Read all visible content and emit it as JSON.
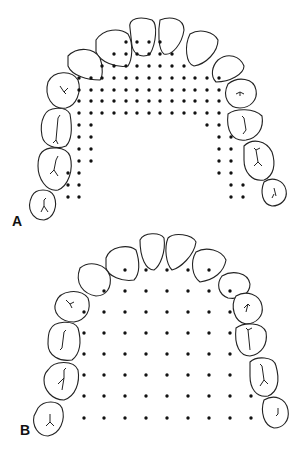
{
  "panels": [
    {
      "id": "A",
      "label": "A",
      "description": "Maxillary arch with dense dot grid (narrow spacing) in U-shaped band"
    },
    {
      "id": "B",
      "label": "B",
      "description": "Maxillary arch with uniform wide dot grid filling palate"
    }
  ],
  "colors": {
    "line": "#222222",
    "dot": "#111111",
    "background": "#ffffff"
  }
}
